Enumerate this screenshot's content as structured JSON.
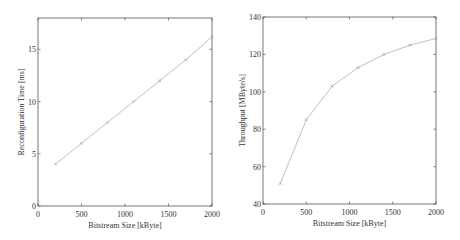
{
  "chart_data": [
    {
      "type": "line",
      "title": "",
      "xlabel": "Bitstream Size [kByte]",
      "ylabel": "Reconfiguration Time [ms]",
      "x": [
        200,
        500,
        800,
        1100,
        1400,
        1700,
        2000
      ],
      "series": [
        {
          "name": "Reconfiguration Time",
          "values": [
            4.0,
            6.0,
            8.0,
            10.0,
            12.0,
            14.0,
            16.2
          ]
        }
      ],
      "xlim": [
        0,
        2000
      ],
      "ylim": [
        0,
        18
      ],
      "xticks": [
        "0",
        "500",
        "1000",
        "1500",
        "2000"
      ],
      "yticks": [
        "0",
        "5",
        "10",
        "15"
      ],
      "grid": false,
      "legend": null,
      "marker": "x",
      "line_color": "#b8b8b8"
    },
    {
      "type": "line",
      "title": "",
      "xlabel": "Bitstream Size [kByte]",
      "ylabel": "Throughput [MByte/s]",
      "x": [
        200,
        500,
        800,
        1100,
        1400,
        1700,
        2000
      ],
      "series": [
        {
          "name": "Throughput",
          "values": [
            51,
            85,
            103,
            113,
            120,
            125,
            128.5
          ]
        }
      ],
      "xlim": [
        0,
        2000
      ],
      "ylim": [
        40,
        140
      ],
      "xticks": [
        "0",
        "500",
        "1000",
        "1500",
        "2000"
      ],
      "yticks": [
        "40",
        "60",
        "80",
        "100",
        "120",
        "140"
      ],
      "grid": false,
      "legend": null,
      "marker": "x",
      "line_color": "#b8b8b8"
    }
  ]
}
